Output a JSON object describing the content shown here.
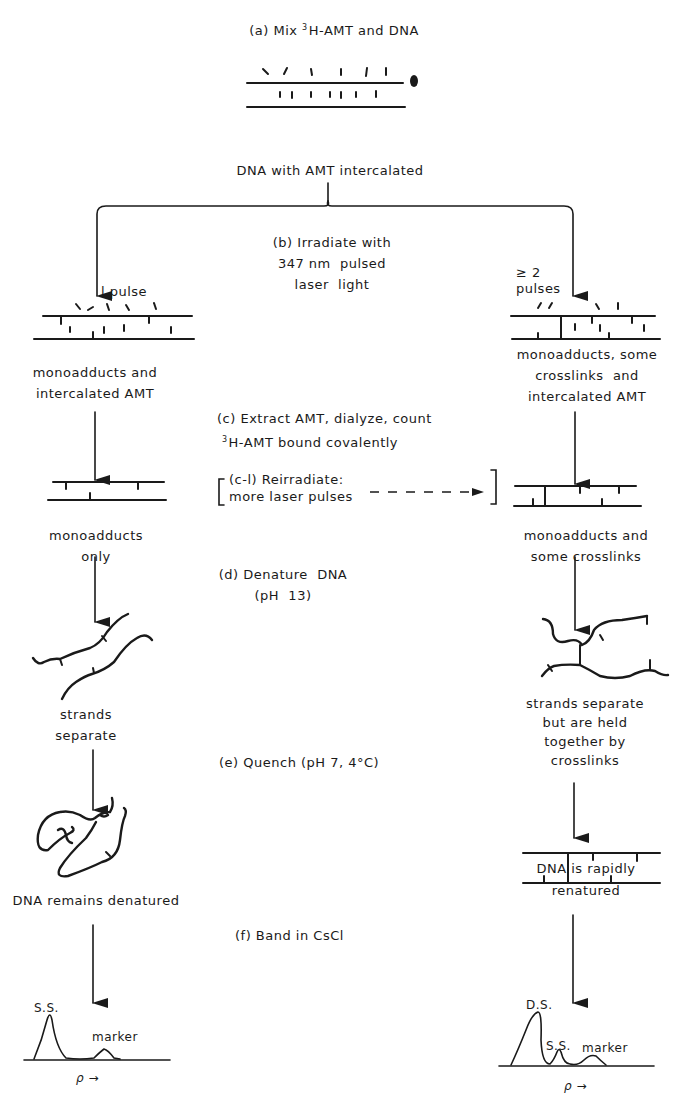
{
  "steps": {
    "a": {
      "label": "(a) Mix ",
      "isotope": "3",
      "rest": "H-AMT  and  DNA"
    },
    "a_result": "DNA with AMT intercalated",
    "b": {
      "line1": "(b) Irradiate with",
      "line2": "347 nm  pulsed",
      "line3": "laser  light"
    },
    "c": {
      "line1": "(c) Extract AMT, dialyze, count",
      "isotope": "3",
      "line2": "H-AMT  bound covalently"
    },
    "c1": {
      "line1": "(c-l) Reirradiate:",
      "line2": "more laser pulses"
    },
    "d": {
      "line1": "(d) Denature  DNA",
      "line2": "(pH  13)"
    },
    "e": {
      "label": "(e) Quench  (pH 7,  4°C)"
    },
    "f": {
      "label": "(f) Band  in  CsCl"
    }
  },
  "left_branch": {
    "pulse_label": "l pulse",
    "after_irradiation": "monoadducts and\nintercalated AMT",
    "after_extraction": "monoadducts\nonly",
    "after_denature": "strands\nseparate",
    "after_quench": "DNA remains denatured",
    "band_plot": {
      "peaks": [
        "S.S.",
        "marker"
      ],
      "axis_label": "ρ →"
    }
  },
  "right_branch": {
    "pulse_label": "≥ 2\npulses",
    "after_irradiation": "monoadducts, some\ncrosslinks  and\nintercalated AMT",
    "after_extraction": "monoadducts and\nsome crosslinks",
    "after_denature": "strands separate\nbut are held\ntogether by\ncrosslinks",
    "after_quench": "DNA is rapidly\nrenatured",
    "band_plot": {
      "peaks": [
        "D.S.",
        "S.S.",
        "marker"
      ],
      "axis_label": "ρ →"
    }
  },
  "colors": {
    "ink": "#1a1a1a",
    "background": "#ffffff"
  }
}
